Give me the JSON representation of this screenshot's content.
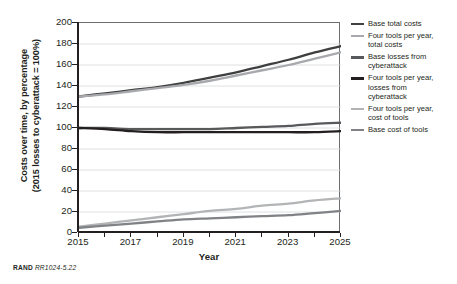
{
  "figure": {
    "source_note_prefix": "RAND",
    "source_note_id": "RR1024-5.22"
  },
  "chart_data": {
    "type": "line",
    "title": "",
    "xlabel": "Year",
    "ylabel_line1": "Costs over time, by percentage",
    "ylabel_line2": "(2015 losses to cyberattack = 100%)",
    "x": [
      2015,
      2016,
      2017,
      2018,
      2019,
      2020,
      2021,
      2022,
      2023,
      2024,
      2025
    ],
    "xlim": [
      2015,
      2025
    ],
    "ylim": [
      0,
      200
    ],
    "xticks": [
      2015,
      2017,
      2019,
      2021,
      2023,
      2025
    ],
    "xticks_minor": [
      2016,
      2018,
      2020,
      2022,
      2024
    ],
    "yticks": [
      0,
      20,
      40,
      60,
      80,
      100,
      120,
      140,
      160,
      180,
      200
    ],
    "grid": "horizontal",
    "legend_position": "right",
    "series": [
      {
        "name": "Base total costs",
        "color": "#3f3f3f",
        "width": 2.3,
        "values": [
          130,
          133,
          136,
          139,
          143,
          148,
          153,
          159,
          165,
          172,
          178
        ]
      },
      {
        "name": "Four tools per year,\ntotal costs",
        "color": "#a7a9ac",
        "width": 2.3,
        "values": [
          130,
          132,
          135,
          138,
          141,
          145,
          150,
          155,
          160,
          166,
          172
        ]
      },
      {
        "name": "Base losses from\ncyberattack",
        "color": "#58595b",
        "width": 2.3,
        "values": [
          100,
          100,
          99,
          99,
          99,
          99,
          100,
          101,
          102,
          104,
          105
        ]
      },
      {
        "name": "Four tools per year,\nlosses from\ncyberattack",
        "color": "#231f20",
        "width": 2.3,
        "values": [
          100,
          99,
          97,
          96,
          96,
          96,
          96,
          96,
          96,
          96,
          97
        ]
      },
      {
        "name": "Four tools per year,\ncost of tools",
        "color": "#b2b4b6",
        "width": 2.3,
        "values": [
          6,
          9,
          12,
          15,
          18,
          21,
          23,
          26,
          28,
          31,
          33
        ]
      },
      {
        "name": "Base cost of tools",
        "color": "#808285",
        "width": 2.3,
        "values": [
          5,
          7,
          9,
          11,
          13,
          14,
          15,
          16,
          17,
          19,
          21
        ]
      }
    ]
  }
}
